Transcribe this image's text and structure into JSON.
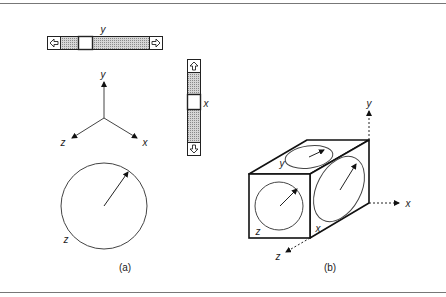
{
  "figure": {
    "panel_a": {
      "caption": "(a)",
      "horizontal_scrollbar": {
        "axis_label": "y",
        "left_arrow_icon": "arrow-left-icon",
        "right_arrow_icon": "arrow-right-icon",
        "thumb_position": 0.25
      },
      "vertical_scrollbar": {
        "axis_label": "x",
        "up_arrow_icon": "arrow-up-icon",
        "down_arrow_icon": "arrow-down-icon",
        "thumb_position": 0.33
      },
      "axes": {
        "y_label": "y",
        "z_label": "z",
        "x_label": "x"
      },
      "dial": {
        "axis_label": "z"
      }
    },
    "panel_b": {
      "caption": "(b)",
      "cube_face_labels": {
        "top": "y",
        "front": "z",
        "side": "x"
      },
      "axes": {
        "y_label": "y",
        "x_label": "x",
        "z_label": "z"
      }
    }
  }
}
